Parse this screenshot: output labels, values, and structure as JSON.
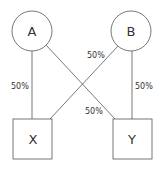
{
  "nodes": {
    "a": {
      "label": "A",
      "shape": "circle"
    },
    "b": {
      "label": "B",
      "shape": "circle"
    },
    "x": {
      "label": "X",
      "shape": "square"
    },
    "y": {
      "label": "Y",
      "shape": "square"
    }
  },
  "edges": [
    {
      "from": "A",
      "to": "X",
      "label": "50%"
    },
    {
      "from": "A",
      "to": "Y",
      "label": "50%"
    },
    {
      "from": "B",
      "to": "X",
      "label": "50%"
    },
    {
      "from": "B",
      "to": "Y",
      "label": "50%"
    }
  ],
  "colors": {
    "stroke": "#555555",
    "text": "#333333"
  }
}
